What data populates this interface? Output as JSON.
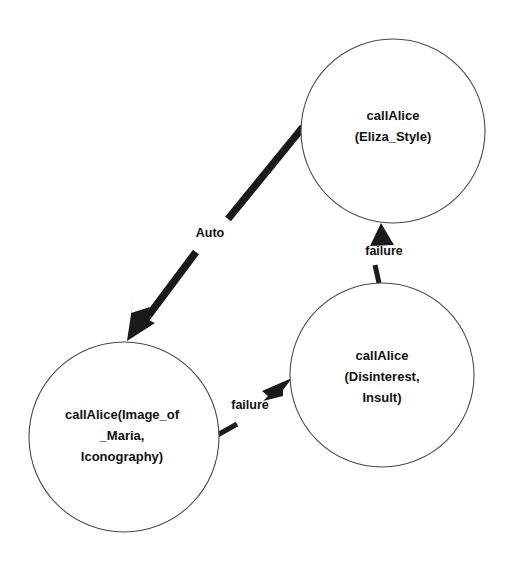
{
  "diagram": {
    "type": "state-transition-graph",
    "background_color": "#ffffff",
    "stroke_color": "#1a1a1a",
    "node_outline_color": "#4a4a4a",
    "nodes": [
      {
        "id": "eliza-style",
        "name": "callAlice (Eliza_Style)",
        "lines": [
          "callAlice",
          "(Eliza_Style)"
        ],
        "cx": 393,
        "cy": 131,
        "r": 92
      },
      {
        "id": "disinterest-insult",
        "name": "callAlice (Disinterest, Insult)",
        "lines": [
          "callAlice",
          "(Disinterest,",
          "Insult)"
        ],
        "cx": 382,
        "cy": 375,
        "r": 92
      },
      {
        "id": "image-of-maria",
        "name": "callAlice(Image_of _Maria, Iconography)",
        "lines": [
          "callAlice(Image_of",
          "_Maria,",
          "Iconography)"
        ],
        "cx": 124,
        "cy": 437,
        "r": 95
      }
    ],
    "edges": [
      {
        "id": "auto-edge",
        "label": "Auto",
        "from": "eliza-style",
        "to": "image-of-maria",
        "weight": "thick",
        "label_x": 210,
        "label_y": 234
      },
      {
        "id": "failure-edge-up",
        "label": "failure",
        "from": "disinterest-insult",
        "to": "eliza-style",
        "weight": "thin",
        "label_x": 384,
        "label_y": 252
      },
      {
        "id": "failure-edge-right",
        "label": "failure",
        "from": "image-of-maria",
        "to": "disinterest-insult",
        "weight": "thin",
        "label_x": 250,
        "label_y": 406
      }
    ]
  }
}
